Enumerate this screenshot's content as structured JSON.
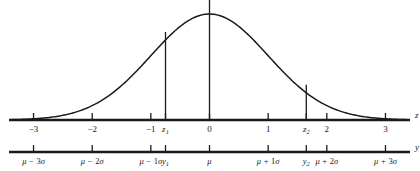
{
  "figure": {
    "background_color": "#ffffff",
    "line_color": "#1a1a1a"
  },
  "chart_data": {
    "type": "line",
    "title": "",
    "xlabel": "z",
    "ylabel": "",
    "xlim": [
      -3.35,
      3.35
    ],
    "ylim": [
      0,
      1.12
    ],
    "grid": false,
    "legend": null,
    "curve": {
      "name": "normal-density",
      "function": "standard normal density",
      "mean": 0,
      "sd": 1,
      "x": [
        -3.3,
        -3.0,
        -2.7,
        -2.4,
        -2.1,
        -1.8,
        -1.5,
        -1.2,
        -0.9,
        -0.6,
        -0.3,
        0.0,
        0.3,
        0.6,
        0.9,
        1.2,
        1.5,
        1.8,
        2.1,
        2.4,
        2.7,
        3.0,
        3.3
      ],
      "y": [
        0.004,
        0.011,
        0.026,
        0.056,
        0.11,
        0.198,
        0.325,
        0.487,
        0.667,
        0.835,
        0.956,
        1.0,
        0.956,
        0.835,
        0.667,
        0.487,
        0.325,
        0.198,
        0.11,
        0.056,
        0.026,
        0.011,
        0.004
      ]
    },
    "vertical_lines": [
      {
        "name": "z1-ordinate",
        "z": -0.75,
        "label": "z1"
      },
      {
        "name": "mean-ordinate",
        "z": 0.0,
        "label": "mu"
      },
      {
        "name": "z2-ordinate",
        "z": 1.65,
        "label": "z2"
      }
    ]
  },
  "z_axis": {
    "name": "z-axis",
    "letter": "z",
    "ticks": [
      {
        "z": -3.0,
        "label": "−3",
        "italic": false
      },
      {
        "z": -2.0,
        "label": "−2",
        "italic": false
      },
      {
        "z": -1.0,
        "label": "−1",
        "italic": false
      },
      {
        "z": -0.75,
        "label": "z",
        "sub": "1",
        "italic": true
      },
      {
        "z": 0.0,
        "label": "0",
        "italic": false
      },
      {
        "z": 1.0,
        "label": "1",
        "italic": false
      },
      {
        "z": 1.65,
        "label": "z",
        "sub": "2",
        "italic": true
      },
      {
        "z": 2.0,
        "label": "2",
        "italic": false
      },
      {
        "z": 3.0,
        "label": "3",
        "italic": false
      }
    ]
  },
  "y_axis": {
    "name": "y-axis",
    "letter": "y",
    "ticks": [
      {
        "z": -3.0,
        "mu": "μ",
        "op": "−",
        "num": "3",
        "sigma": "σ"
      },
      {
        "z": -2.0,
        "mu": "μ",
        "op": "−",
        "num": "2",
        "sigma": "σ"
      },
      {
        "z": -1.0,
        "mu": "μ",
        "op": "−",
        "num": "1",
        "sigma": "σ"
      },
      {
        "z": -0.75,
        "mu": "y",
        "sub": "1"
      },
      {
        "z": 0.0,
        "mu": "μ"
      },
      {
        "z": 1.0,
        "mu": "μ",
        "op": "+",
        "num": "1",
        "sigma": "σ"
      },
      {
        "z": 1.65,
        "mu": "y",
        "sub": "2"
      },
      {
        "z": 2.0,
        "mu": "μ",
        "op": "+",
        "num": "2",
        "sigma": "σ"
      },
      {
        "z": 3.0,
        "mu": "μ",
        "op": "+",
        "num": "3",
        "sigma": "σ"
      }
    ]
  }
}
